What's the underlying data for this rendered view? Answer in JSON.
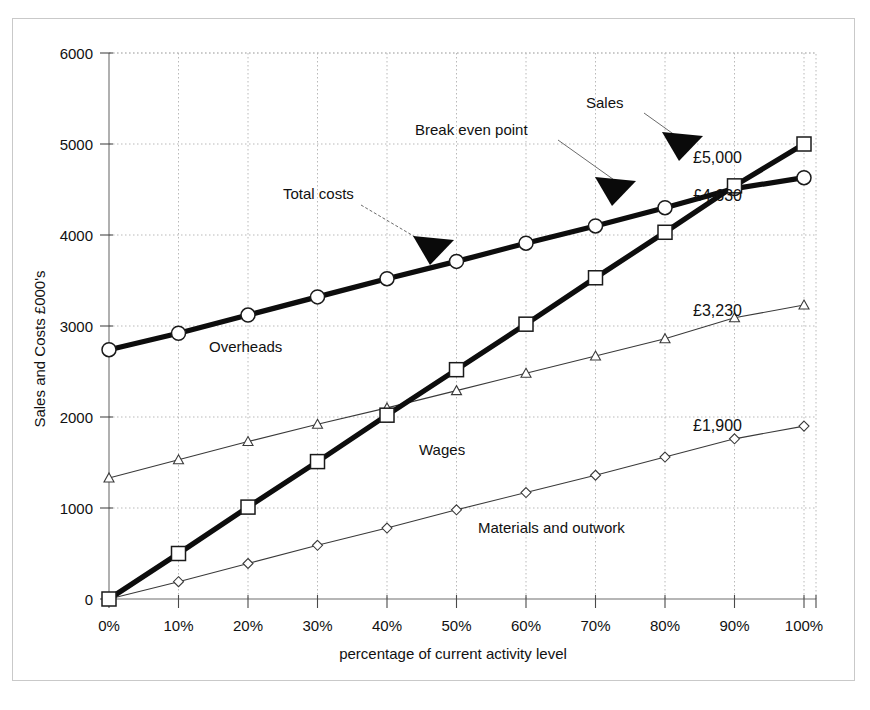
{
  "chart_data": {
    "type": "line",
    "title": "",
    "xlabel": "percentage of current activity level",
    "ylabel": "Sales and Costs £000's",
    "categories": [
      "0%",
      "10%",
      "20%",
      "30%",
      "40%",
      "50%",
      "60%",
      "70%",
      "80%",
      "90%",
      "100%"
    ],
    "x": [
      0,
      10,
      20,
      30,
      40,
      50,
      60,
      70,
      80,
      90,
      100
    ],
    "xlim": [
      0,
      100
    ],
    "ylim": [
      0,
      6000
    ],
    "ytick_labels": [
      "0",
      "1000",
      "2000",
      "3000",
      "4000",
      "5000",
      "6000"
    ],
    "yticks": [
      0,
      1000,
      2000,
      3000,
      4000,
      5000,
      6000
    ],
    "grid": true,
    "legend_position": "inline-annotations",
    "series": [
      {
        "name": "Sales",
        "marker": "square",
        "line_weight": "thick",
        "end_value_label": "£5,000",
        "values": [
          0,
          500,
          1010,
          1510,
          2020,
          2520,
          3020,
          3530,
          4030,
          4540,
          5000
        ]
      },
      {
        "name": "Total costs",
        "marker": "circle",
        "line_weight": "thick",
        "end_value_label": "£4,630",
        "values": [
          2740,
          2920,
          3120,
          3320,
          3520,
          3710,
          3910,
          4100,
          4300,
          4510,
          4630
        ]
      },
      {
        "name": "Wages",
        "marker": "triangle",
        "line_weight": "thin",
        "end_value_label": "£3,230",
        "values": [
          1330,
          1530,
          1730,
          1920,
          2100,
          2290,
          2480,
          2670,
          2860,
          3090,
          3230
        ]
      },
      {
        "name": "Materials and outwork",
        "marker": "diamond",
        "line_weight": "thin",
        "end_value_label": "£1,900",
        "values": [
          0,
          190,
          390,
          590,
          780,
          980,
          1170,
          1360,
          1560,
          1760,
          1900
        ]
      }
    ],
    "annotations": [
      {
        "text": "Sales",
        "kind": "callout",
        "points_to": "sales-line"
      },
      {
        "text": "Break even point",
        "kind": "callout",
        "points_to": "intersection-of-sales-and-total-costs"
      },
      {
        "text": "Total costs",
        "kind": "callout",
        "points_to": "total-costs-line"
      },
      {
        "text": "Overheads",
        "kind": "area-label"
      },
      {
        "text": "Wages",
        "kind": "area-label"
      },
      {
        "text": "Materials and outwork",
        "kind": "area-label"
      }
    ],
    "break_even": {
      "x": "90%",
      "value": 4520
    }
  },
  "axis": {
    "y_title": "Sales and Costs £000's",
    "x_title": "percentage of current activity level",
    "y_labels": [
      "6000",
      "5000",
      "4000",
      "3000",
      "2000",
      "1000",
      "0"
    ],
    "x_labels": [
      "0%",
      "10%",
      "20%",
      "30%",
      "40%",
      "50%",
      "60%",
      "70%",
      "80%",
      "90%",
      "100%"
    ]
  },
  "annotations": {
    "sales": "Sales",
    "break_even_point": "Break even point",
    "total_costs": "Total costs",
    "overheads": "Overheads",
    "wages": "Wages",
    "materials": "Materials and outwork"
  },
  "value_labels": {
    "sales_end": "£5,000",
    "total_costs_end": "£4,630",
    "wages_end": "£3,230",
    "materials_end": "£1,900"
  },
  "colors": {
    "ink": "#0d0d0d",
    "grid": "#b9b9b9",
    "axis": "#6f6f6f",
    "background": "#ffffff",
    "border": "#c9c9c9"
  }
}
